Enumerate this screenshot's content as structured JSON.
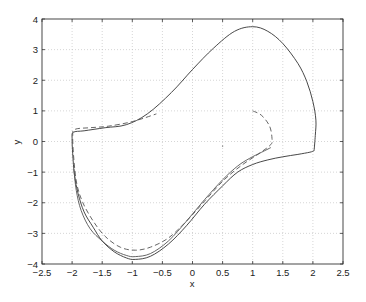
{
  "chart_data": {
    "type": "line",
    "title": "",
    "xlabel": "x",
    "ylabel": "y",
    "xlim": [
      -2.5,
      2.5
    ],
    "ylim": [
      -4,
      4
    ],
    "grid": true,
    "legend": null,
    "xticks": [
      -2.5,
      -2,
      -1.5,
      -1,
      -0.5,
      0,
      0.5,
      1,
      1.5,
      2,
      2.5
    ],
    "xtick_labels": [
      "-2.5",
      "-2",
      "-1.5",
      "-1",
      "-0.5",
      "0",
      "0.5",
      "1",
      "1.5",
      "2",
      "2.5"
    ],
    "yticks": [
      -4,
      -3,
      -2,
      -1,
      0,
      1,
      2,
      3,
      4
    ],
    "ytick_labels": [
      "-4",
      "-3",
      "-2",
      "-1",
      "0",
      "1",
      "2",
      "3",
      "4"
    ],
    "series": [
      {
        "name": "limit-cycle-solid",
        "style": "solid",
        "color": "#333333",
        "x": [
          2.02,
          2.04,
          2.05,
          2.0,
          1.9,
          1.75,
          1.5,
          1.25,
          1.0,
          0.7,
          0.35,
          0.0,
          -0.35,
          -0.75,
          -1.1,
          -1.45,
          -1.8,
          -1.98,
          -2.0,
          -1.99,
          -1.96,
          -1.9,
          -1.8,
          -1.65,
          -1.5,
          -1.3,
          -1.1,
          -0.95,
          -0.7,
          -0.4,
          -0.1,
          0.2,
          0.5,
          0.75,
          1.0,
          1.25,
          1.5,
          1.75,
          1.95,
          2.02
        ],
        "y": [
          -0.3,
          0.2,
          0.7,
          1.3,
          1.95,
          2.55,
          3.2,
          3.6,
          3.75,
          3.6,
          3.05,
          2.35,
          1.6,
          0.9,
          0.55,
          0.45,
          0.35,
          0.3,
          0.1,
          -0.4,
          -1.1,
          -1.7,
          -2.3,
          -2.8,
          -3.25,
          -3.6,
          -3.8,
          -3.85,
          -3.75,
          -3.35,
          -2.75,
          -2.05,
          -1.45,
          -1.0,
          -0.75,
          -0.6,
          -0.5,
          -0.42,
          -0.35,
          -0.3
        ]
      },
      {
        "name": "trajectory-solid-inner",
        "style": "solid",
        "color": "#555555",
        "x": [
          -1.97,
          -1.93,
          -1.85,
          -1.7,
          -1.5,
          -1.3,
          -1.1,
          -0.95,
          -0.7,
          -0.4,
          -0.1,
          0.2,
          0.5,
          0.75,
          0.95,
          1.15,
          1.3
        ],
        "y": [
          -0.9,
          -1.6,
          -2.25,
          -2.85,
          -3.25,
          -3.55,
          -3.72,
          -3.76,
          -3.66,
          -3.25,
          -2.6,
          -1.9,
          -1.25,
          -0.8,
          -0.55,
          -0.35,
          -0.2
        ]
      },
      {
        "name": "trajectory-dashed",
        "style": "dashed",
        "color": "#555555",
        "x": [
          1.0,
          1.15,
          1.28,
          1.32,
          1.3,
          1.1,
          0.8,
          0.5,
          0.2,
          -0.1,
          -0.4,
          -0.7,
          -0.95,
          -1.2,
          -1.45,
          -1.65,
          -1.82,
          -1.92,
          -1.97,
          -1.99,
          -1.95,
          -1.7,
          -1.4,
          -1.0,
          -0.6
        ],
        "y": [
          1.0,
          0.85,
          0.5,
          0.1,
          -0.1,
          -0.4,
          -0.8,
          -1.3,
          -1.95,
          -2.6,
          -3.15,
          -3.45,
          -3.55,
          -3.45,
          -3.1,
          -2.6,
          -2.0,
          -1.4,
          -0.6,
          0.2,
          0.4,
          0.45,
          0.5,
          0.65,
          0.9
        ]
      }
    ],
    "annotations": [
      {
        "type": "point",
        "x": 0.5,
        "y": -0.15
      }
    ]
  }
}
